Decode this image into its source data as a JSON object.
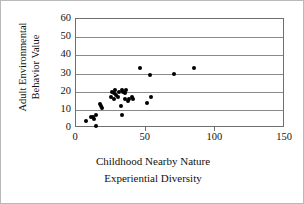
{
  "chart_data": {
    "type": "scatter",
    "title": "",
    "xlabel": "Childhood Nearby Nature Experiential Diversity",
    "xlabel_lines": [
      "Childhood Nearby Nature",
      "Experiential Diversity"
    ],
    "ylabel": "Adult Environmental Behavior Value",
    "ylabel_lines": [
      "Adult Environmental",
      "Behavior Value"
    ],
    "xlim": [
      0,
      150
    ],
    "ylim": [
      0,
      60
    ],
    "xticks": [
      0,
      50,
      100,
      150
    ],
    "yticks": [
      0,
      10,
      20,
      30,
      40,
      50,
      60
    ],
    "grid": "horizontal",
    "legend": "none",
    "marker": "filled-circle",
    "marker_color": "#000000",
    "points": [
      {
        "x": 7,
        "y": 4
      },
      {
        "x": 11,
        "y": 6
      },
      {
        "x": 12,
        "y": 6
      },
      {
        "x": 13,
        "y": 5
      },
      {
        "x": 14,
        "y": 7
      },
      {
        "x": 14,
        "y": 1
      },
      {
        "x": 17,
        "y": 13
      },
      {
        "x": 18,
        "y": 12
      },
      {
        "x": 19,
        "y": 11
      },
      {
        "x": 25,
        "y": 17
      },
      {
        "x": 26,
        "y": 20
      },
      {
        "x": 27,
        "y": 19
      },
      {
        "x": 27,
        "y": 16
      },
      {
        "x": 28,
        "y": 21
      },
      {
        "x": 29,
        "y": 18
      },
      {
        "x": 30,
        "y": 17
      },
      {
        "x": 31,
        "y": 20
      },
      {
        "x": 32,
        "y": 12
      },
      {
        "x": 33,
        "y": 7
      },
      {
        "x": 33,
        "y": 21
      },
      {
        "x": 34,
        "y": 20
      },
      {
        "x": 35,
        "y": 16
      },
      {
        "x": 35,
        "y": 19
      },
      {
        "x": 36,
        "y": 21
      },
      {
        "x": 37,
        "y": 15
      },
      {
        "x": 38,
        "y": 16
      },
      {
        "x": 40,
        "y": 17
      },
      {
        "x": 41,
        "y": 16
      },
      {
        "x": 46,
        "y": 33
      },
      {
        "x": 51,
        "y": 14
      },
      {
        "x": 53,
        "y": 29
      },
      {
        "x": 54,
        "y": 17
      },
      {
        "x": 70,
        "y": 30
      },
      {
        "x": 85,
        "y": 33
      }
    ]
  }
}
